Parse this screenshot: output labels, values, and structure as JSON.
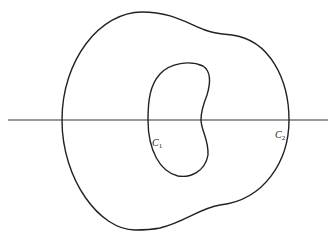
{
  "diagram": {
    "curves": [
      {
        "id": "C1",
        "label": "C",
        "subscript": "1",
        "description": "inner bean-shaped closed curve"
      },
      {
        "id": "C2",
        "label": "C",
        "subscript": "2",
        "description": "outer closed curve"
      }
    ],
    "axis": {
      "description": "horizontal line crossing both curves"
    },
    "colors": {
      "stroke": "#222222",
      "background": "#ffffff"
    }
  }
}
